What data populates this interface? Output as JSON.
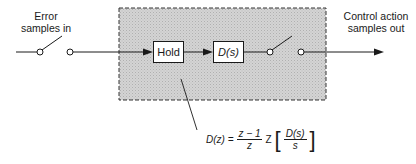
{
  "diagram": {
    "input_label": [
      "Error",
      "samples in"
    ],
    "output_label": [
      "Control action",
      "samples out"
    ],
    "blocks": [
      {
        "id": "hold",
        "label": "Hold"
      },
      {
        "id": "ds",
        "label": "D(s)"
      }
    ],
    "formula": {
      "lhs": "D(z) =",
      "frac_num": "z − 1",
      "frac_den": "z",
      "operator": "Z",
      "inner_num": "D(s)",
      "inner_den": "s"
    },
    "colors": {
      "shaded_region": "#cfcfcf",
      "line": "#1a1a1a"
    }
  }
}
